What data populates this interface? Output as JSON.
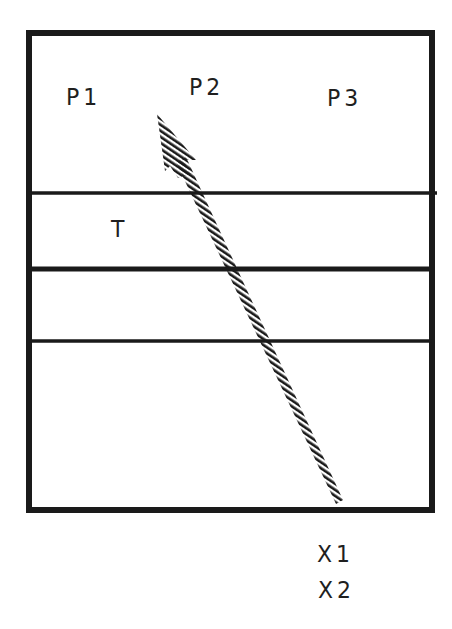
{
  "diagram": {
    "labels": {
      "p1": "P1",
      "p2": "P2",
      "p3": "P3",
      "t": "T",
      "x1": "X1",
      "x2": "X2"
    },
    "frame": {
      "x": 26,
      "y": 30,
      "width": 409,
      "height": 483,
      "stroke": "#1a1a1a"
    },
    "horizontal_lines": [
      {
        "y": 193,
        "thickness": 3
      },
      {
        "y": 269,
        "thickness": 5
      },
      {
        "y": 341,
        "thickness": 3
      }
    ],
    "arrow": {
      "style": "hatched",
      "tip": [
        157,
        114
      ],
      "tail": [
        340,
        502
      ],
      "color": "#1a1a1a"
    }
  }
}
